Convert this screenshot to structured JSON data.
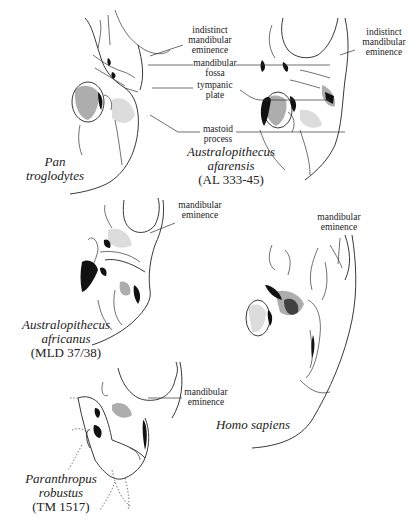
{
  "figure": {
    "panels": [
      {
        "id": "pan",
        "species_line1": "Pan",
        "species_line2": "troglodytes",
        "specimen": ""
      },
      {
        "id": "afarensis",
        "species_line1": "Australopithecus",
        "species_line2": "afarensis",
        "specimen": "(AL 333-45)"
      },
      {
        "id": "africanus",
        "species_line1": "Australopithecus",
        "species_line2": "africanus",
        "specimen": "(MLD 37/38)"
      },
      {
        "id": "homo",
        "species_line1": "Homo sapiens",
        "species_line2": "",
        "specimen": ""
      },
      {
        "id": "paranthropus",
        "species_line1": "Paranthropus",
        "species_line2": "robustus",
        "specimen": "(TM 1517)"
      }
    ],
    "labels": {
      "indistinct_eminence_center": [
        "indistinct",
        "mandibular",
        "eminence"
      ],
      "mandibular_fossa": [
        "mandibular",
        "fossa"
      ],
      "tympanic_plate": [
        "tympanic",
        "plate"
      ],
      "mastoid_process": [
        "mastoid",
        "process"
      ],
      "indistinct_eminence_right": [
        "indistinct",
        "mandibular",
        "eminence"
      ],
      "africanus_eminence": [
        "mandibular",
        "eminence"
      ],
      "homo_eminence": [
        "mandibular",
        "eminence"
      ],
      "paranthropus_eminence": [
        "mandibular",
        "eminence"
      ]
    }
  }
}
